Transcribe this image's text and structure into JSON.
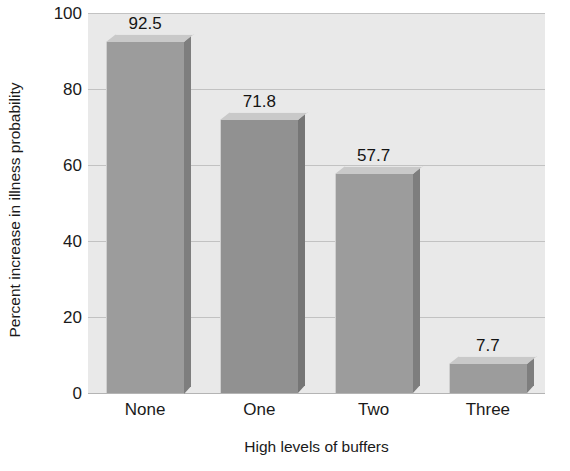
{
  "chart_data": {
    "type": "bar",
    "title": "",
    "xlabel": "High levels of buffers",
    "ylabel": "Percent increase in illness probability",
    "categories": [
      "None",
      "One",
      "Two",
      "Three"
    ],
    "values": [
      92.5,
      71.8,
      57.7,
      7.7
    ],
    "value_labels": [
      "92.5",
      "71.8",
      "57.7",
      "7.7"
    ],
    "ylim": [
      0,
      100
    ],
    "yticks": [
      0,
      20,
      40,
      60,
      80,
      100
    ],
    "ytick_labels": [
      "0",
      "20",
      "40",
      "60",
      "80",
      "100"
    ],
    "grid": true,
    "legend": "none",
    "style": "3d-bar",
    "colors": {
      "plot_background": "#e9e9e9",
      "bar_front": "#9c9c9c",
      "bar_front_dark": "#919191",
      "bar_top": "#c9c9c9",
      "bar_side": "#7e7e7e",
      "gridline": "#c2c2c2",
      "text": "#1a1a1a"
    }
  }
}
